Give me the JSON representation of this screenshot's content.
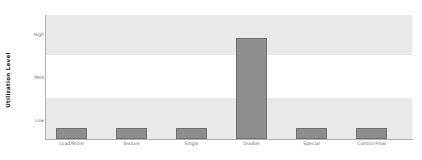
{
  "chart_data": {
    "type": "bar",
    "title": "",
    "xlabel": "",
    "ylabel": "Utilization Level",
    "categories": [
      "Load/Store",
      "Texture",
      "Single",
      "Double",
      "Special",
      "Control Flow"
    ],
    "values": [
      1,
      1,
      1,
      5,
      1,
      1
    ],
    "value_levels": [
      "Low",
      "Low",
      "Low",
      "High",
      "Low",
      "Low"
    ],
    "ytick_labels": [
      "High",
      "Med",
      "Low"
    ],
    "ylim": [
      0,
      6
    ],
    "grid": false,
    "bands": "alternating horizontal shaded bands behind plot",
    "legend": "none",
    "bar_color": "#8e8e8e",
    "bar_edge_color": "#6f6f6f",
    "band_color": "#e9e9e9",
    "background_color": "#ffffff",
    "axis_color": "#b0b0b0",
    "tick_label_color": "#6b6b6b",
    "axis_title_color": "#1a1a2e"
  },
  "axis": {
    "y_title": "Utilization Level",
    "y_ticks": [
      {
        "label": "High",
        "top_px": 33
      },
      {
        "label": "Med",
        "top_px": 76
      },
      {
        "label": "Low",
        "top_px": 119
      }
    ]
  },
  "bands": [
    {
      "name": "high-band",
      "top_px": 0,
      "height_px": 40,
      "shaded": true
    },
    {
      "name": "med-band",
      "top_px": 40,
      "height_px": 43,
      "shaded": false
    },
    {
      "name": "low-band",
      "top_px": 83,
      "height_px": 41,
      "shaded": true
    }
  ],
  "bars": [
    {
      "category": "Load/Store",
      "left_px": 10,
      "width_px": 31,
      "height_px": 11
    },
    {
      "category": "Texture",
      "left_px": 70,
      "width_px": 31,
      "height_px": 11
    },
    {
      "category": "Single",
      "left_px": 130,
      "width_px": 31,
      "height_px": 11
    },
    {
      "category": "Double",
      "left_px": 190,
      "width_px": 31,
      "height_px": 101
    },
    {
      "category": "Special",
      "left_px": 250,
      "width_px": 31,
      "height_px": 11
    },
    {
      "category": "Control Flow",
      "left_px": 310,
      "width_px": 31,
      "height_px": 11
    }
  ]
}
